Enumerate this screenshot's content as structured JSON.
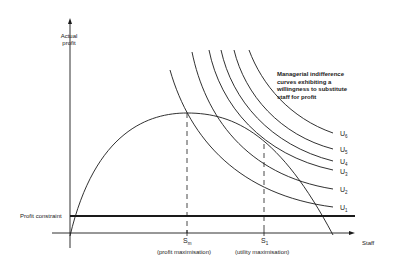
{
  "diagram": {
    "y_axis_label": "Actual profit",
    "y_axis_label_line1": "Actual",
    "y_axis_label_line2": "profit",
    "x_axis_label": "Staff",
    "profit_constraint_label": "Profit constraint",
    "annotation": "Managerial indifference curves exhibiting a willingness to substitute staff for profit",
    "annotation_lines": [
      "Managerial indifference",
      "curves exhibiting a",
      "willingness to substitute",
      "staff for profit"
    ],
    "markers": [
      {
        "symbol": "S",
        "subscript": "m",
        "caption": "(profit maximisation)"
      },
      {
        "symbol": "S",
        "subscript": "1",
        "caption": "(utility maximisation)"
      }
    ],
    "indifference_curves": [
      {
        "symbol": "U",
        "subscript": "6"
      },
      {
        "symbol": "U",
        "subscript": "5"
      },
      {
        "symbol": "U",
        "subscript": "4"
      },
      {
        "symbol": "U",
        "subscript": "3"
      },
      {
        "symbol": "U",
        "subscript": "2"
      },
      {
        "symbol": "U",
        "subscript": "1"
      }
    ],
    "colors": {
      "line": "#1a1a1a",
      "background": "#ffffff"
    }
  }
}
